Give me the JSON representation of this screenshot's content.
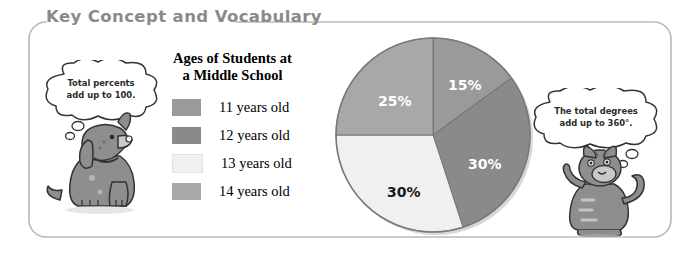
{
  "panel": {
    "title": "Key Concept and Vocabulary",
    "title_color": "#8a8a8a",
    "border_color": "#b9b9b9"
  },
  "legend": {
    "title_line1": "Ages of Students at",
    "title_line2": "a Middle School",
    "items": [
      {
        "label": "11 years old",
        "color": "#9a9a9a"
      },
      {
        "label": "12 years old",
        "color": "#8a8a8a"
      },
      {
        "label": "13 years old",
        "color": "#f0f0f0"
      },
      {
        "label": "14 years old",
        "color": "#a8a8a8"
      }
    ]
  },
  "characters": {
    "dog": {
      "name": "dog-character",
      "bubble_line1": "Total percents",
      "bubble_line2": "add up to 100."
    },
    "cat": {
      "name": "cat-character",
      "bubble_line1": "The total degrees",
      "bubble_line2": "add up to 360°."
    }
  },
  "chart_data": {
    "type": "pie",
    "title": "Ages of Students at a Middle School",
    "categories": [
      "11 years old",
      "12 years old",
      "13 years old",
      "14 years old"
    ],
    "values": [
      15,
      30,
      30,
      25
    ],
    "labels": [
      "15%",
      "30%",
      "30%",
      "25%"
    ],
    "colors": [
      "#9a9a9a",
      "#8a8a8a",
      "#f0f0f0",
      "#a8a8a8"
    ],
    "label_colors": [
      "#ffffff",
      "#ffffff",
      "#1a1a1a",
      "#ffffff"
    ],
    "start_angle_deg": 0,
    "direction": "clockwise",
    "units": "percent",
    "total": 100,
    "legend_position": "left",
    "grid": false,
    "center": {
      "x": 103,
      "y": 103
    },
    "radius": 97,
    "label_positions": [
      {
        "x": 118,
        "y": 45
      },
      {
        "x": 138,
        "y": 124
      },
      {
        "x": 57,
        "y": 152
      },
      {
        "x": 48,
        "y": 61
      }
    ]
  }
}
